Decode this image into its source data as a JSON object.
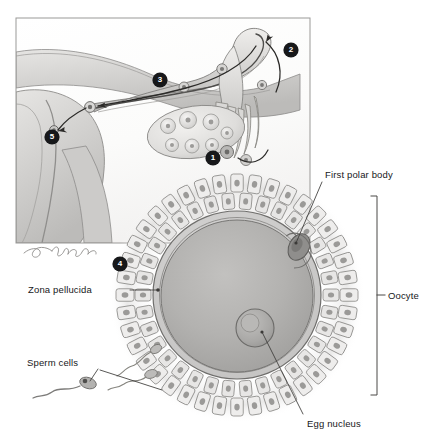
{
  "figure": {
    "style": "grayscale medical illustration",
    "signature": "Leighton",
    "colors": {
      "background": "#ffffff",
      "tissue_light": "#e3e2e0",
      "tissue_mid": "#c9c8c6",
      "tissue_dark": "#a9a8a6",
      "outline": "#6e6d6b",
      "text": "#17181a",
      "marker_fill": "#17181a",
      "marker_text": "#ffffff",
      "cytoplasm": "#b2b1af",
      "nucleus": "#a5a4a2",
      "zona": "#cdcccb",
      "corona_cell": "#eeedec"
    }
  },
  "inset": {
    "name": "female-reproductive-tract-inset",
    "description": "Cross-section of uterus, uterine tube, and ovary",
    "frame": {
      "x": 16,
      "y": 18,
      "width": 294,
      "height": 225
    }
  },
  "labels": [
    {
      "id": "first-polar-body",
      "text": "First polar body"
    },
    {
      "id": "oocyte",
      "text": "Oocyte"
    },
    {
      "id": "zona-pellucida",
      "text": "Zona pellucida"
    },
    {
      "id": "sperm-cells",
      "text": "Sperm cells"
    },
    {
      "id": "egg-nucleus",
      "text": "Egg nucleus"
    }
  ],
  "markers": [
    {
      "number": "1",
      "cx": 213,
      "cy": 158,
      "target": "ovulation at ovary surface"
    },
    {
      "number": "2",
      "cx": 291,
      "cy": 50,
      "target": "fimbriae of uterine tube"
    },
    {
      "number": "3",
      "cx": 160,
      "cy": 80,
      "target": "uterine tube ampulla"
    },
    {
      "number": "4",
      "cx": 120,
      "cy": 264,
      "target": "corona radiata of oocyte"
    },
    {
      "number": "5",
      "cx": 52,
      "cy": 137,
      "target": "implantation site in uterus"
    }
  ],
  "structures": {
    "oocyte": {
      "cx": 237,
      "cy": 295,
      "r": 104
    },
    "cytoplasm": {
      "cx": 237,
      "cy": 296,
      "r": 77
    },
    "egg_nucleus": {
      "cx": 255,
      "cy": 328,
      "r": 18
    },
    "polar_body": {
      "cx": 299,
      "cy": 247,
      "rx": 10,
      "ry": 14
    },
    "sperm_count": 3
  },
  "bracket": {
    "x": 377,
    "top": 195,
    "bottom": 396,
    "label": "Oocyte"
  }
}
